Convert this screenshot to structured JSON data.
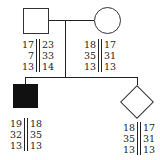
{
  "pedigree": {
    "father": {
      "symbol": "square",
      "sex": "male",
      "affected": false,
      "haplotype_left": [
        "17",
        "7",
        "13"
      ],
      "haplotype_right": [
        "23",
        "33",
        "14"
      ]
    },
    "mother": {
      "symbol": "circle",
      "sex": "female",
      "affected": false,
      "haplotype_left": [
        "18",
        "35",
        "13"
      ],
      "haplotype_right": [
        "17",
        "31",
        "13"
      ]
    },
    "child1": {
      "symbol": "filled-square",
      "sex": "male",
      "affected": true,
      "haplotype_left": [
        "19",
        "32",
        "13"
      ],
      "haplotype_right": [
        "18",
        "35",
        "13"
      ]
    },
    "child2": {
      "symbol": "diamond",
      "sex": "unknown",
      "affected": false,
      "haplotype_left": [
        "18",
        "35",
        "13"
      ],
      "haplotype_right": [
        "17",
        "31",
        "13"
      ]
    }
  },
  "colors": {
    "line": "#222222",
    "affected_fill": "#111111",
    "background": "#ffffff"
  }
}
